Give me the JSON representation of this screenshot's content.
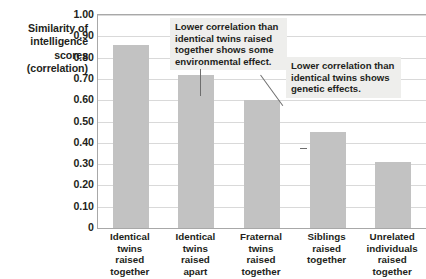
{
  "chart_data": {
    "type": "bar",
    "title": "",
    "subtitle": "",
    "xlabel": "",
    "ylabel": "Similarity of intelligence scores (correlation)",
    "ylabel_lines": [
      "Similarity of",
      "intelligence",
      "scores",
      "(correlation)"
    ],
    "categories": [
      "Identical twins raised together",
      "Identical twins raised apart",
      "Fraternal twins raised together",
      "Siblings raised together",
      "Unrelated individuals raised together"
    ],
    "category_lines": [
      [
        "Identical",
        "twins",
        "raised",
        "together"
      ],
      [
        "Identical",
        "twins",
        "raised",
        "apart"
      ],
      [
        "Fraternal",
        "twins",
        "raised",
        "together"
      ],
      [
        "Siblings",
        "raised",
        "together"
      ],
      [
        "Unrelated",
        "individuals",
        "raised",
        "together"
      ]
    ],
    "values": [
      0.86,
      0.72,
      0.6,
      0.45,
      0.31
    ],
    "ylim": [
      0,
      1.0
    ],
    "ytick_values": [
      1.0,
      0.9,
      0.8,
      0.7,
      0.6,
      0.5,
      0.4,
      0.3,
      0.2,
      0.1,
      0
    ],
    "ytick_labels": [
      "1.00",
      "0.90",
      "0.80",
      "0.70",
      "0.60",
      "0.50",
      "0.40",
      "0.30",
      "0.20",
      "0.10",
      "0"
    ],
    "grid": true,
    "grid_axis": "y",
    "legend": false,
    "legend_position": "none",
    "bar_color": "#c2c2c2",
    "grid_color": "#d9d9d9",
    "axis_color": "#a8a8a8",
    "text_color": "#231f20",
    "callout_background": "#eeeeec",
    "annotations": [
      {
        "text": "Lower correlation than identical twins raised together shows some environmental effect.",
        "lines": [
          "Lower correlation than",
          "identical twins raised",
          "together shows some",
          "environmental effect."
        ],
        "points_to_category": "Identical twins raised apart",
        "leader": "vertical"
      },
      {
        "text": "Lower correlation than identical twins shows genetic effects.",
        "lines": [
          "Lower correlation than",
          "identical twins shows",
          "genetic effects."
        ],
        "points_to_category": "Fraternal twins raised together",
        "leader": "diagonal"
      }
    ]
  }
}
